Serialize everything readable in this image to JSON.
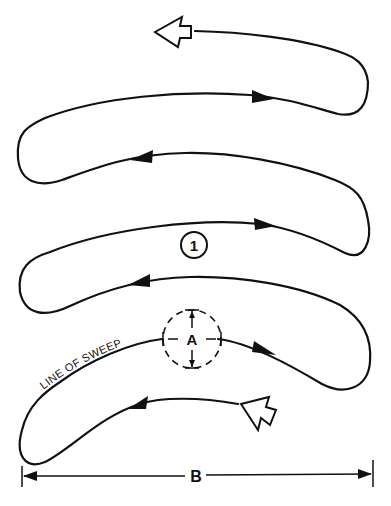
{
  "diagram": {
    "labels": {
      "leg_number": "1",
      "sweep_width": "A",
      "total_width": "B",
      "line_of_sweep": "LINE OF SWEEP"
    },
    "start_marker": "open-arrow-start",
    "end_marker": "open-arrow-end",
    "colors": {
      "line": "#111111",
      "background": "#ffffff"
    }
  }
}
